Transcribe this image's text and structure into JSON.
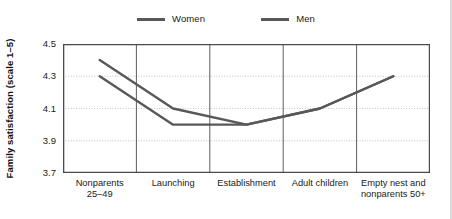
{
  "chart_data": {
    "type": "line",
    "title": "",
    "xlabel": "",
    "ylabel": "Family satisfaction (scale 1–5)",
    "ylim": [
      3.7,
      4.5
    ],
    "yticks": [
      "3.7",
      "3.9",
      "4.1",
      "4.3",
      "4.5"
    ],
    "ytick_values": [
      3.7,
      3.9,
      4.1,
      4.3,
      4.5
    ],
    "grid": "horizontal-dotted",
    "legend_position": "top-center",
    "categories": [
      "Nonparents\n25–49",
      "Launching",
      "Establishment",
      "Adult children",
      "Empty nest and\nnonparents 50+"
    ],
    "series": [
      {
        "name": "Women",
        "color": "#585858",
        "values": [
          4.4,
          4.1,
          4.0,
          4.1,
          4.3
        ]
      },
      {
        "name": "Men",
        "color": "#585858",
        "values": [
          4.3,
          4.0,
          4.0,
          4.1,
          4.3
        ]
      }
    ]
  },
  "legend": {
    "entries": [
      {
        "label": "Women"
      },
      {
        "label": "Men"
      }
    ]
  },
  "axes": {
    "y_title": "Family satisfaction (scale 1–5)",
    "y_ticks": [
      "4.5",
      "4.3",
      "4.1",
      "3.9",
      "3.7"
    ],
    "x_ticks": [
      "Nonparents\n25–49",
      "Launching",
      "Establishment",
      "Adult children",
      "Empty nest and\nnonparents 50+"
    ]
  },
  "colors": {
    "line": "#585858",
    "axis": "#4a4a4a",
    "grid": "#bdbdbd",
    "text": "#1a1a1a",
    "background": "#ffffff"
  }
}
